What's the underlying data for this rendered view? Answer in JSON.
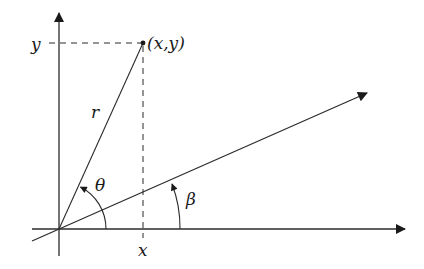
{
  "diagram": {
    "colors": {
      "stroke": "#2b2b2b",
      "background": "#ffffff"
    },
    "labels": {
      "y_tick": "y",
      "x_tick": "x",
      "point": "(x,y)",
      "radius": "r",
      "theta": "θ",
      "beta": "β"
    },
    "elements": {
      "vertical_axis": "y-axis",
      "horizontal_axis": "x-axis",
      "rotated_axis": "axis rotated by β",
      "radius_line": "r from origin to (x,y)",
      "dashed_projections": [
        "horizontal to y",
        "vertical to x"
      ],
      "angle_arcs": [
        "θ",
        "β"
      ]
    }
  }
}
